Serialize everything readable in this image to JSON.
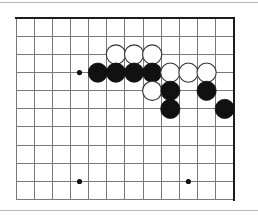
{
  "figure": {
    "kind": "go-board-diagram",
    "background_color": "#ffffff",
    "frame_color": "#b9b9b9"
  },
  "board": {
    "title": "go-board",
    "grid": {
      "origin_x": 16,
      "origin_y": 18,
      "spacing": 18.15,
      "columns": 13,
      "rows": 11,
      "line_color": "#7a7a7a",
      "line_width": 1,
      "edge_color": "#1c1c1c",
      "edge_width": 2.2,
      "edge_top": true,
      "edge_right": true,
      "edge_left": false,
      "edge_bottom": false
    },
    "star_points": [
      {
        "col": 3,
        "row": 3,
        "x": 79.5,
        "y": 72.6
      },
      {
        "col": 3,
        "row": 9,
        "x": 79.5,
        "y": 181.5
      },
      {
        "col": 9,
        "row": 9,
        "x": 188.4,
        "y": 181.5
      }
    ],
    "star_point_radius": 2.6,
    "star_point_color": "#111111",
    "stone_radius": 9.6,
    "colors": {
      "black_fill": "#111111",
      "black_stroke": "#111111",
      "white_fill": "#ffffff",
      "white_stroke": "#333333"
    },
    "stones": [
      {
        "color": "white",
        "col": 6,
        "row": 2,
        "x": 115.9,
        "y": 54.5
      },
      {
        "color": "white",
        "col": 7,
        "row": 2,
        "x": 134.1,
        "y": 54.5
      },
      {
        "color": "white",
        "col": 8,
        "row": 2,
        "x": 152.2,
        "y": 54.5
      },
      {
        "color": "black",
        "col": 5,
        "row": 3,
        "x": 97.8,
        "y": 72.6
      },
      {
        "color": "black",
        "col": 6,
        "row": 3,
        "x": 115.9,
        "y": 72.6
      },
      {
        "color": "black",
        "col": 7,
        "row": 3,
        "x": 134.1,
        "y": 72.6
      },
      {
        "color": "black",
        "col": 8,
        "row": 3,
        "x": 152.2,
        "y": 72.6
      },
      {
        "color": "white",
        "col": 9,
        "row": 3,
        "x": 170.3,
        "y": 72.6
      },
      {
        "color": "white",
        "col": 10,
        "row": 3,
        "x": 188.4,
        "y": 72.6
      },
      {
        "color": "white",
        "col": 11,
        "row": 3,
        "x": 206.6,
        "y": 72.6
      },
      {
        "color": "white",
        "col": 8,
        "row": 4,
        "x": 152.2,
        "y": 90.8
      },
      {
        "color": "black",
        "col": 9,
        "row": 4,
        "x": 170.3,
        "y": 90.8
      },
      {
        "color": "black",
        "col": 11,
        "row": 4,
        "x": 206.6,
        "y": 90.8
      },
      {
        "color": "black",
        "col": 9,
        "row": 5,
        "x": 170.3,
        "y": 108.9
      },
      {
        "color": "black",
        "col": 12,
        "row": 5,
        "x": 224.7,
        "y": 108.9
      }
    ],
    "stone_counts": {
      "black": 9,
      "white": 7,
      "total": 16
    }
  }
}
